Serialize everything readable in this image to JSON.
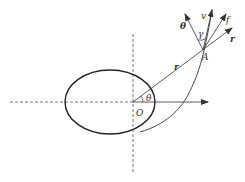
{
  "diagram": {
    "labels": {
      "origin": "O",
      "point": "A",
      "angle_theta": "θ",
      "gamma": "γ",
      "radius": "r",
      "unit_theta": "θ",
      "velocity": "v",
      "force": "f",
      "unit_r": "r"
    },
    "colors": {
      "stroke": "#333333",
      "background": "#ffffff"
    }
  }
}
